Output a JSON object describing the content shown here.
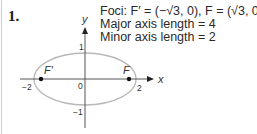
{
  "problem": {
    "number": "1."
  },
  "info": {
    "foci_line": "Foci: F′ = (−√3, 0), F = (√3, 0)",
    "major_line": "Major axis length = 4",
    "minor_line": "Minor axis length = 2"
  },
  "axes": {
    "x_label": "x",
    "y_label": "y",
    "origin_label": "0",
    "x_ticks": [
      "−2",
      "2"
    ],
    "y_ticks": [
      "1",
      "−1"
    ]
  },
  "foci": {
    "left_label": "F′",
    "right_label": "F"
  },
  "colors": {
    "ellipse": "#b8b8b8",
    "axes": "#555555",
    "points": "#111111"
  }
}
